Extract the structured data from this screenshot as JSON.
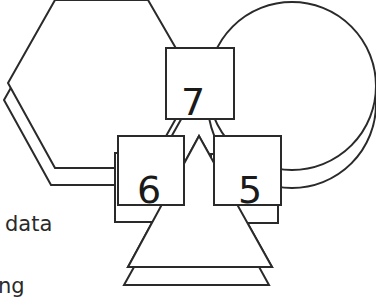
{
  "diagram": {
    "boxes": [
      {
        "id": "box-7",
        "label": "7"
      },
      {
        "id": "box-6",
        "label": "6"
      },
      {
        "id": "box-5",
        "label": "5"
      }
    ],
    "shapes": [
      "hexagon",
      "circle",
      "triangle"
    ],
    "text_fragments": [
      "data",
      "ng"
    ],
    "stroke_color": "#2a2a2a",
    "background_color": "#ffffff"
  }
}
